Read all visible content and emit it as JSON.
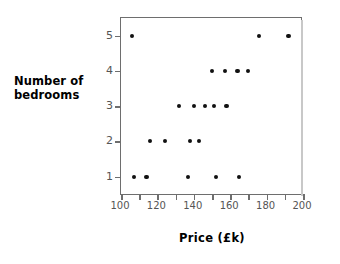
{
  "chart_data": {
    "type": "scatter",
    "title": "",
    "xlabel": "Price  (£k)",
    "ylabel": "Number of bedrooms",
    "ylabel_lines": [
      "Number of",
      "bedrooms"
    ],
    "xlim": [
      100,
      200
    ],
    "ylim": [
      0.45,
      5.5
    ],
    "xticks": [
      100,
      110,
      120,
      130,
      140,
      150,
      160,
      170,
      180,
      190,
      200
    ],
    "xticklabels": [
      "100",
      "",
      "120",
      "",
      "140",
      "",
      "160",
      "",
      "180",
      "",
      "200"
    ],
    "yticks": [
      1,
      2,
      3,
      4,
      5
    ],
    "yticklabels": [
      "1",
      "2",
      "3",
      "4",
      "5"
    ],
    "grid": false,
    "legend": false,
    "marker": "filled-circle",
    "marker_color": "#111111",
    "points": [
      {
        "x": 106,
        "y": 5
      },
      {
        "x": 176,
        "y": 5
      },
      {
        "x": 192,
        "y": 5
      },
      {
        "x": 150,
        "y": 4
      },
      {
        "x": 157,
        "y": 4
      },
      {
        "x": 164,
        "y": 4
      },
      {
        "x": 170,
        "y": 4
      },
      {
        "x": 132,
        "y": 3
      },
      {
        "x": 140,
        "y": 3
      },
      {
        "x": 146,
        "y": 3
      },
      {
        "x": 151,
        "y": 3
      },
      {
        "x": 158,
        "y": 3
      },
      {
        "x": 116,
        "y": 2
      },
      {
        "x": 124,
        "y": 2
      },
      {
        "x": 138,
        "y": 2
      },
      {
        "x": 143,
        "y": 2
      },
      {
        "x": 107,
        "y": 1
      },
      {
        "x": 114,
        "y": 1
      },
      {
        "x": 137,
        "y": 1
      },
      {
        "x": 152,
        "y": 1
      },
      {
        "x": 165,
        "y": 1
      }
    ]
  }
}
